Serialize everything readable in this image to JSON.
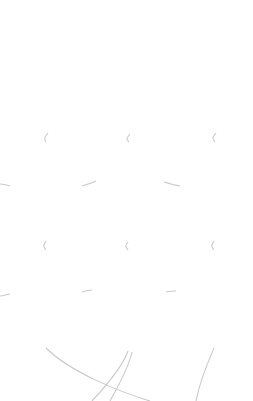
{
  "meta": {
    "background_color": "#ffffff",
    "balloon_outline_color": "#3a3a3a",
    "balloon_fill_light": "#ffffff",
    "balloon_fill_dark": "#ababab",
    "text_color": "#141414",
    "corner_label_color": "#a8a8a8",
    "string_color": "#c9c9c9"
  },
  "corner": {
    "label": "Litriú"
  },
  "edge": {
    "clipped_word": "uic"
  },
  "balloons": [
    {
      "id": "ina-chonai",
      "label": "ina chónaí",
      "lines": [
        "ina",
        "chónaí"
      ],
      "font_size": 15,
      "x": 12,
      "y": 28,
      "w": 72,
      "h": 93
    },
    {
      "id": "thainig-se",
      "label": "Tháinig sé",
      "lines": [
        "Tháinig",
        "sé"
      ],
      "font_size": 15,
      "x": 95,
      "y": 28,
      "w": 69,
      "h": 94
    },
    {
      "id": "de-sathairn",
      "label": "Dé Sathairn",
      "lines": [
        "Dé",
        "Sathairn"
      ],
      "font_size": 15,
      "x": 180,
      "y": 27,
      "w": 71,
      "h": 94
    },
    {
      "id": "seo-caite",
      "label": "seo caite",
      "lines": [
        "seo",
        "caite"
      ],
      "font_size": 15,
      "x": 10,
      "y": 142,
      "w": 72,
      "h": 87
    },
    {
      "id": "eitlean",
      "label": "eitleán",
      "lines": [
        "eitleán"
      ],
      "font_size": 15,
      "x": 95,
      "y": 142,
      "w": 69,
      "h": 88
    },
    {
      "id": "aerfort",
      "label": "aerfort",
      "lines": [
        "aerfort"
      ],
      "font_size": 15,
      "x": 180,
      "y": 142,
      "w": 71,
      "h": 87
    },
    {
      "id": "thuirling",
      "label": "Thuirling",
      "lines": [
        "Thuirling"
      ],
      "font_size": 15,
      "x": 10,
      "y": 250,
      "w": 72,
      "h": 87
    },
    {
      "id": "ruidbhealach",
      "label": "rúidbhealach",
      "lines": [
        "rúidbhealach"
      ],
      "font_size": 12,
      "x": 92,
      "y": 250,
      "w": 74,
      "h": 90
    },
    {
      "id": "paisineiri",
      "label": "paisinéirí",
      "lines": [
        "paisinéirí"
      ],
      "font_size": 14,
      "x": 176,
      "y": 250,
      "w": 77,
      "h": 87
    },
    {
      "id": "aerostach",
      "label": "aeróstach",
      "lines": [
        "aeróstach"
      ],
      "font_size": 14,
      "x": 130,
      "y": 348,
      "w": 85,
      "h": 90
    }
  ]
}
